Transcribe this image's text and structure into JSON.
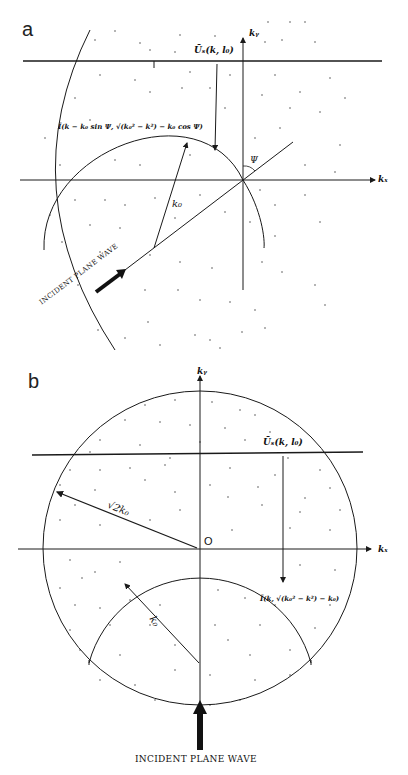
{
  "panels": {
    "a": {
      "label": "a",
      "axis_x_label": "kₓ",
      "axis_y_label": "kᵧ",
      "field_label": "Ũₛ(k, l₀)",
      "ewald_label": "Ĩ(k − k₀ sin Ψ, √(k₀² − k²) − k₀ cos Ψ)",
      "radius_label": "k₀",
      "angle_label": "Ψ",
      "incident_label": "INCIDENT PLANE WAVE"
    },
    "b": {
      "label": "b",
      "axis_x_label": "kₓ",
      "axis_y_label": "kᵧ",
      "origin_label": "O",
      "field_label": "Ũₛ(k, l₀)",
      "large_radius_label": "√2k₀",
      "ewald_label": "Ĩ(k, √(k₀² − k²) − k₀)",
      "radius_label": "k₀",
      "incident_label": "INCIDENT PLANE WAVE"
    }
  },
  "colors": {
    "line": "#1a1a1a",
    "dots": "#555555",
    "background": "#ffffff"
  }
}
